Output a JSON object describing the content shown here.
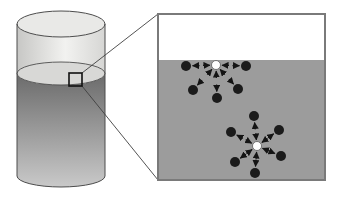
{
  "figure": {
    "canvas": {
      "width": 341,
      "height": 202,
      "background": "#ffffff"
    },
    "colors": {
      "outline": "#4d4d4d",
      "glass_edge": "#c7c7c5",
      "glass_mid": "#f2f2f0",
      "glass_right": "#d6d6d4",
      "liquid_dark": "#6b6b6b",
      "liquid_light": "#c9c9c9",
      "surface_face": "#d8d8d6",
      "top_face": "#e9e9e7",
      "inset_air": "#ffffff",
      "inset_liquid": "#9c9c9c",
      "inset_border": "#7a7a7a",
      "molecule_dark": "#1b1b1b",
      "molecule_light_fill": "#ffffff",
      "molecule_light_stroke": "#5a5a5a",
      "arrow": "#141414",
      "connector": "#3f3f3f",
      "zoom_box_stroke": "#111111"
    },
    "cylinder": {
      "cx": 61,
      "rx": 44,
      "left": 17,
      "right": 105,
      "top_cy": 24,
      "top_ry": 13,
      "surface_cy": 73.5,
      "surface_ry": 11.5,
      "bottom_cy": 176,
      "bottom_ry": 11
    },
    "zoom_box": {
      "x": 69,
      "y": 73,
      "w": 13,
      "h": 13
    },
    "connectors": [
      {
        "x1": 82,
        "y1": 73,
        "x2": 158,
        "y2": 14
      },
      {
        "x1": 82,
        "y1": 86,
        "x2": 158,
        "y2": 180
      }
    ],
    "inset": {
      "x": 158,
      "y": 14,
      "w": 167,
      "h": 166,
      "surface_y": 60
    },
    "molecule_radius": {
      "light": 4.5,
      "dark": 5
    },
    "arrow_geometry": {
      "head_len": 7,
      "head_width": 7,
      "stand_off": 1.5,
      "tail_len": 7,
      "stroke_width": 1.1
    },
    "clusters": [
      {
        "name": "surface-molecule",
        "center": {
          "x": 216,
          "y": 65
        },
        "neighbors": [
          {
            "x": 186,
            "y": 66
          },
          {
            "x": 246,
            "y": 66
          },
          {
            "x": 193,
            "y": 90
          },
          {
            "x": 217,
            "y": 98
          },
          {
            "x": 238,
            "y": 89
          }
        ]
      },
      {
        "name": "bulk-molecule",
        "center": {
          "x": 257,
          "y": 146
        },
        "neighbors": [
          {
            "x": 254,
            "y": 116
          },
          {
            "x": 231,
            "y": 132
          },
          {
            "x": 279,
            "y": 130
          },
          {
            "x": 281,
            "y": 156
          },
          {
            "x": 235,
            "y": 162
          },
          {
            "x": 255,
            "y": 173
          }
        ]
      }
    ]
  }
}
